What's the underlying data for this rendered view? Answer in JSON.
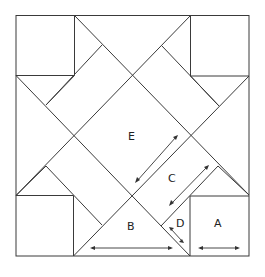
{
  "diagram": {
    "type": "quilt-block-pattern",
    "pieces": [
      {
        "id": "A",
        "label": "A",
        "shape": "square"
      },
      {
        "id": "B",
        "label": "B",
        "shape": "large-triangle"
      },
      {
        "id": "C",
        "label": "C",
        "shape": "rectangle"
      },
      {
        "id": "D",
        "label": "D",
        "shape": "small-triangle"
      },
      {
        "id": "E",
        "label": "E",
        "shape": "center-square"
      }
    ],
    "grain_arrows": [
      "E",
      "C",
      "D",
      "B",
      "A"
    ],
    "colors": {
      "line": "#3a3a3a",
      "background": "#ffffff",
      "text": "#222222"
    }
  }
}
